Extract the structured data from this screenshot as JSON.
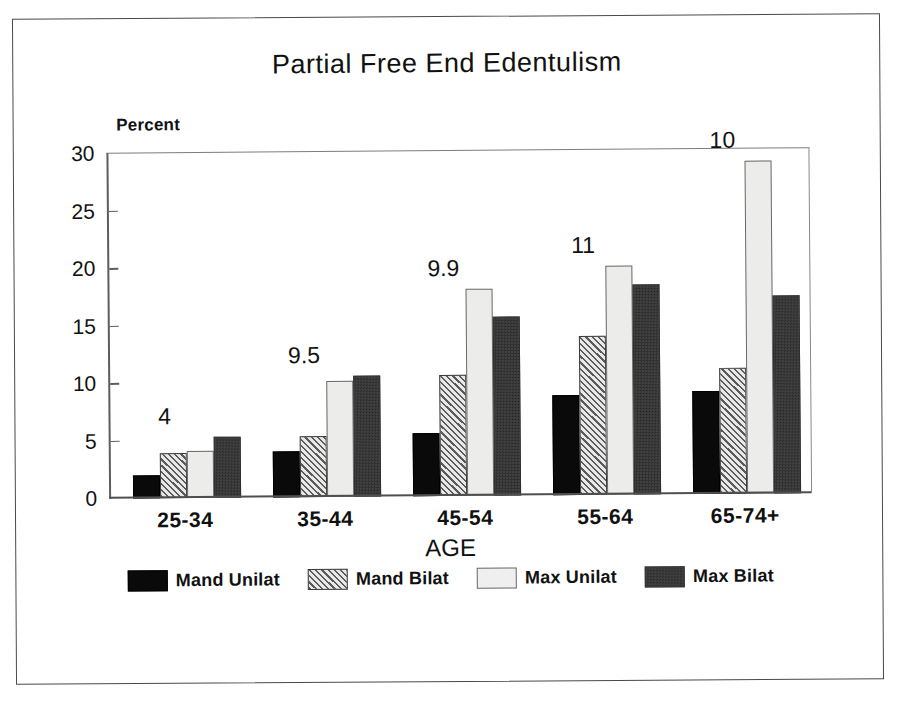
{
  "chart_data": {
    "type": "bar",
    "title": "Partial Free End Edentulism",
    "xlabel": "AGE",
    "ylabel": "Percent",
    "ylim": [
      0,
      30
    ],
    "yticks": [
      0,
      5,
      10,
      15,
      20,
      25,
      30
    ],
    "grid": false,
    "legend_position": "bottom",
    "categories": [
      "25-34",
      "35-44",
      "45-54",
      "55-64",
      "65-74+"
    ],
    "series": [
      {
        "name": "Mand Unilat",
        "fill": "solid-black",
        "color": "#0a0a0a",
        "values": [
          2.0,
          4.0,
          5.5,
          8.7,
          9.0
        ]
      },
      {
        "name": "Mand Bilat",
        "fill": "diagonal-hatch",
        "color": "#8a8a8a",
        "values": [
          3.9,
          5.3,
          10.5,
          13.8,
          11.0
        ]
      },
      {
        "name": "Max Unilat",
        "fill": "light-stipple",
        "color": "#ececeb",
        "values": [
          4.1,
          10.1,
          18.0,
          19.9,
          29.0
        ]
      },
      {
        "name": "Max Bilat",
        "fill": "dark-stipple",
        "color": "#5e5e5e",
        "values": [
          5.3,
          10.5,
          15.6,
          18.3,
          17.2
        ]
      }
    ],
    "group_annotations": [
      "4",
      "9.5",
      "9.9",
      "11",
      "10"
    ]
  }
}
